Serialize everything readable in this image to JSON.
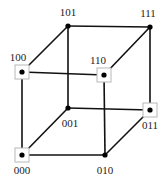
{
  "diagram": {
    "nodes": [
      {
        "id": "000",
        "label": "000",
        "x": 22,
        "y": 155,
        "boxed": true,
        "lx": 22,
        "ly": 174
      },
      {
        "id": "001",
        "label": "001",
        "x": 68,
        "y": 108,
        "boxed": false,
        "lx": 70,
        "ly": 127
      },
      {
        "id": "010",
        "label": "010",
        "x": 105,
        "y": 155,
        "boxed": false,
        "lx": 105,
        "ly": 174
      },
      {
        "id": "011",
        "label": "011",
        "x": 150,
        "y": 110,
        "boxed": true,
        "lx": 150,
        "ly": 129
      },
      {
        "id": "100",
        "label": "100",
        "x": 22,
        "y": 72,
        "boxed": true,
        "lx": 18,
        "ly": 61
      },
      {
        "id": "101",
        "label": "101",
        "x": 68,
        "y": 26,
        "boxed": false,
        "lx": 68,
        "ly": 16
      },
      {
        "id": "110",
        "label": "110",
        "x": 104,
        "y": 75,
        "boxed": true,
        "lx": 98,
        "ly": 64
      },
      {
        "id": "111",
        "label": "111",
        "x": 150,
        "y": 27,
        "boxed": false,
        "lx": 148,
        "ly": 17
      }
    ],
    "edges": [
      [
        "000",
        "001"
      ],
      [
        "000",
        "010"
      ],
      [
        "000",
        "100"
      ],
      [
        "001",
        "011"
      ],
      [
        "001",
        "101"
      ],
      [
        "010",
        "011"
      ],
      [
        "010",
        "110"
      ],
      [
        "011",
        "111"
      ],
      [
        "100",
        "101"
      ],
      [
        "100",
        "110"
      ],
      [
        "101",
        "111"
      ],
      [
        "110",
        "111"
      ]
    ],
    "colors": {
      "edge": "#111111",
      "box_border": "#b8b8b8",
      "dot": "#000000"
    }
  }
}
